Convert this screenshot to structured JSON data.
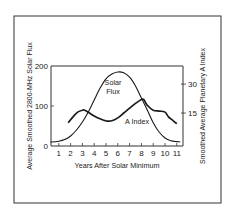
{
  "chart_data": {
    "type": "line",
    "title": "",
    "xlabel": "Years After Solar Minimum",
    "ylabel": "Average Smoothed 2800-MHz Solar Flux",
    "ylabel_right": "Smoothed Average Planetary A Index",
    "xlim": [
      0.3,
      11.3
    ],
    "ylim": [
      0,
      200
    ],
    "ylim_right": [
      0,
      37
    ],
    "x_ticks": [
      1,
      2,
      3,
      4,
      5,
      6,
      7,
      8,
      9,
      10,
      11
    ],
    "y_ticks": [
      0,
      100,
      200
    ],
    "y_ticks_right": [
      15,
      30
    ],
    "grid": false,
    "legend": "inline labels",
    "series": [
      {
        "name": "Solar Flux",
        "axis": "left",
        "label_lines": [
          "Solar",
          "Flux"
        ],
        "x": [
          0.3,
          1,
          1.5,
          2,
          2.5,
          3,
          3.5,
          4,
          4.5,
          5,
          5.5,
          6,
          6.5,
          7,
          7.5,
          8,
          8.5,
          9,
          9.5,
          10,
          10.5,
          11,
          11.3
        ],
        "values": [
          10,
          12,
          16,
          25,
          40,
          60,
          85,
          115,
          145,
          168,
          180,
          185,
          183,
          172,
          150,
          120,
          90,
          58,
          35,
          20,
          13,
          11,
          10
        ]
      },
      {
        "name": "A Index",
        "axis": "right",
        "label_lines": [
          "A Index"
        ],
        "x": [
          1.8,
          2.2,
          2.6,
          3,
          3.2,
          3.6,
          4,
          4.5,
          5,
          5.5,
          6,
          6.5,
          7,
          7.5,
          8,
          8.2,
          8.5,
          9,
          9.5,
          10,
          10.3,
          10.7,
          11
        ],
        "values": [
          10,
          13,
          15.5,
          16.5,
          16.5,
          15,
          13.5,
          12,
          11,
          11,
          12.5,
          15,
          17.5,
          20,
          22,
          22,
          19,
          16.5,
          16,
          15.5,
          13,
          11,
          9.5
        ]
      }
    ]
  },
  "layout": {
    "outer_box": {
      "x": 14,
      "y": 16,
      "w": 207,
      "h": 187
    },
    "plot_box": {
      "x": 51,
      "y": 66,
      "w": 132,
      "h": 80
    },
    "x0_px": 47,
    "px_per_year": 11.8,
    "left_zero_px": 146,
    "left_px_per_unit": 0.4,
    "right_zero_px": 142,
    "right_px_per_unit": 1.93,
    "line_color": "#1a1a1a",
    "border_color": "#333333"
  },
  "labels": {
    "xlabel": "Years After Solar Minimum",
    "ylabel_left": "Average Smoothed 2800-MHz Solar Flux",
    "ylabel_right": "Smoothed Average Planetary A Index",
    "solar_flux_line1": "Solar",
    "solar_flux_line2": "Flux",
    "a_index": "A Index"
  }
}
